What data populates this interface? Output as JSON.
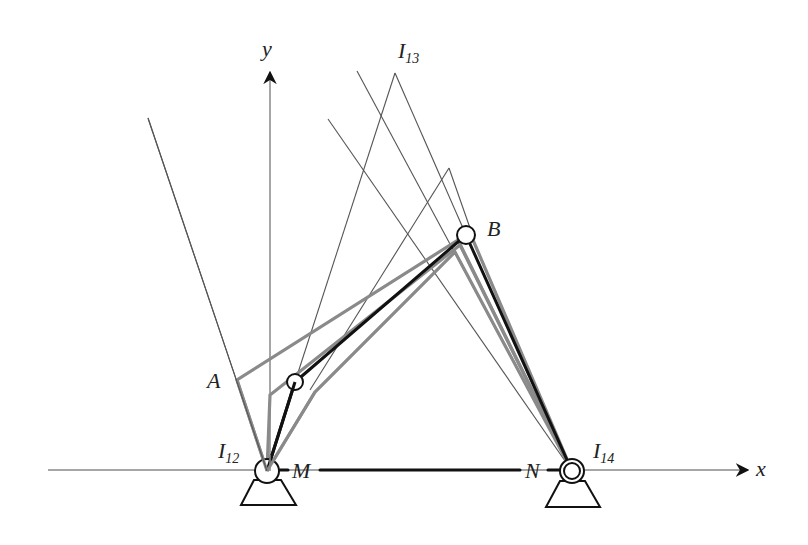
{
  "diagram": {
    "colors": {
      "thin_line": "#555555",
      "grey_link": "#8a8a8a",
      "black_link": "#111111",
      "axis": "#888888",
      "background": "#ffffff"
    },
    "axes": {
      "x_label": "x",
      "y_label": "y"
    },
    "labels": {
      "A": "A",
      "B": "B",
      "M": "M",
      "N": "N",
      "I12_main": "I",
      "I12_sub": "12",
      "I13_main": "I",
      "I13_sub": "13",
      "I14_main": "I",
      "I14_sub": "14"
    },
    "points": {
      "M_pivot": [
        267,
        471
      ],
      "N_pivot": [
        572,
        471
      ],
      "crank_joint": [
        295,
        382
      ],
      "B_joint": [
        466,
        235
      ],
      "A": [
        237,
        380
      ],
      "I13": [
        395,
        73
      ]
    }
  }
}
